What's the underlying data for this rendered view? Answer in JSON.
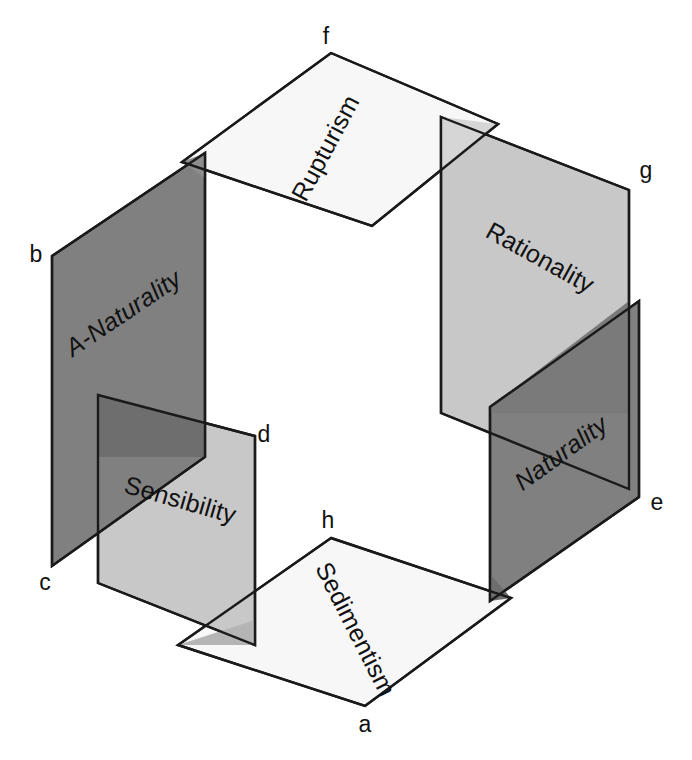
{
  "diagram": {
    "type": "isometric-intersecting-planes",
    "title": "",
    "background_color": "#ffffff",
    "outline_color": "#1a1a1a",
    "palette": {
      "white": "#f7f7f7",
      "light_gray": "#c8c8c8",
      "dark_gray": "#808080",
      "overlap_dark": "#6e6e6e",
      "overlap_mid": "#9a9a9a"
    },
    "planes": [
      {
        "id": "rupturism",
        "label": "Rupturism",
        "fill": "#f7f7f7",
        "orientation": "horizontal-top",
        "italic": false,
        "points": "331,53 498,124 372,226 182,162",
        "label_x": 333,
        "label_y": 152,
        "label_rotate": -62,
        "label_anchor": "middle"
      },
      {
        "id": "a-naturality",
        "label": "A-Naturality",
        "fill": "#808080",
        "orientation": "vertical-upper-left",
        "italic": true,
        "points": "52,256 205,153 205,457 52,566",
        "label_x": 128,
        "label_y": 320,
        "label_rotate": -34,
        "label_anchor": "middle"
      },
      {
        "id": "rationality",
        "label": "Rationality",
        "fill": "#c8c8c8",
        "orientation": "vertical-upper-right",
        "italic": false,
        "points": "441,117 629,190 629,489 441,413",
        "label_x": 536,
        "label_y": 265,
        "label_rotate": 29,
        "label_anchor": "middle"
      },
      {
        "id": "sensibility",
        "label": "Sensibility",
        "fill": "#c8c8c8",
        "orientation": "vertical-lower-left",
        "italic": false,
        "points": "98,395 255,436 255,645 98,583",
        "label_x": 178,
        "label_y": 508,
        "label_rotate": 16,
        "label_anchor": "middle"
      },
      {
        "id": "naturality",
        "label": "Naturality",
        "fill": "#808080",
        "orientation": "vertical-lower-right",
        "italic": true,
        "points": "490,407 639,301 639,497 490,601",
        "label_x": 566,
        "label_y": 460,
        "label_rotate": -36,
        "label_anchor": "middle"
      },
      {
        "id": "sedimentism",
        "label": "Sedimentism",
        "fill": "#f7f7f7",
        "orientation": "horizontal-bottom",
        "italic": false,
        "points": "331,538 511,598 365,706 178,645",
        "label_x": 348,
        "label_y": 633,
        "label_rotate": 63,
        "label_anchor": "middle"
      }
    ],
    "vertex_labels": [
      {
        "id": "a",
        "text": "a",
        "x": 365,
        "y": 732
      },
      {
        "id": "b",
        "text": "b",
        "x": 36,
        "y": 262
      },
      {
        "id": "c",
        "text": "c",
        "x": 45,
        "y": 590
      },
      {
        "id": "d",
        "text": "d",
        "x": 264,
        "y": 442
      },
      {
        "id": "e",
        "text": "e",
        "x": 657,
        "y": 510
      },
      {
        "id": "f",
        "text": "f",
        "x": 326,
        "y": 44
      },
      {
        "id": "g",
        "text": "g",
        "x": 646,
        "y": 178
      },
      {
        "id": "h",
        "text": "h",
        "x": 328,
        "y": 528
      }
    ]
  }
}
